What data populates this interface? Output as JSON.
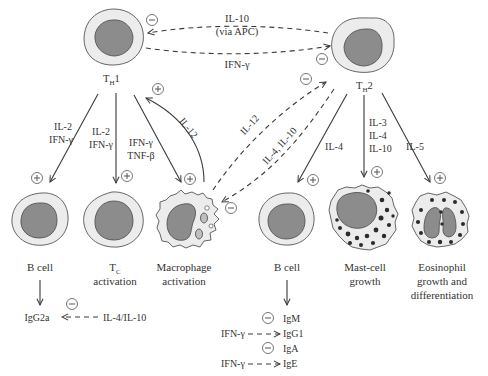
{
  "diagram": {
    "type": "immune-regulation-pathway",
    "cells": {
      "th1": {
        "label_main": "T",
        "label_sub": "H",
        "label_suffix": "1"
      },
      "th2": {
        "label_main": "T",
        "label_sub": "H",
        "label_suffix": "2"
      },
      "b_cell_left": {
        "caption": "B cell"
      },
      "tc": {
        "caption_main": "T",
        "caption_sub": "C",
        "caption_line2": "activation"
      },
      "macrophage": {
        "caption_line1": "Macrophage",
        "caption_line2": "activation"
      },
      "b_cell_right": {
        "caption": "B cell"
      },
      "mast_cell": {
        "caption_line1": "Mast-cell",
        "caption_line2": "growth"
      },
      "eosinophil": {
        "caption_line1": "Eosinophil",
        "caption_line2": "growth and",
        "caption_line3": "differentiation"
      }
    },
    "cross_regulation": {
      "th2_to_th1_line1": "IL-10",
      "th2_to_th1_line2": "(via APC)",
      "th1_to_th2": "IFN-γ"
    },
    "th1_arrows": {
      "to_bcell_line1": "IL-2",
      "to_bcell_line2": "IFN-γ",
      "to_tc_line1": "IL-2",
      "to_tc_line2": "IFN-γ",
      "to_macrophage_line1": "IFN-γ",
      "to_macrophage_line2": "TNF-β",
      "macrophage_to_th1": "IL-12"
    },
    "macrophage_th2": {
      "macrophage_to_th2": "IL-12",
      "th2_to_macrophage": "IL-4, IL-10"
    },
    "th2_arrows": {
      "to_bcell": "IL-4",
      "to_mast_line1": "IL-3",
      "to_mast_line2": "IL-4",
      "to_mast_line3": "IL-10",
      "to_eosinophil": "IL-5"
    },
    "left_isotype": {
      "product": "IgG2a",
      "inhibitor": "IL-4/IL-10"
    },
    "right_isotypes": {
      "items": [
        "IgM",
        "IgG1",
        "IgA",
        "IgE"
      ],
      "inhibitor_1": "IFN-γ",
      "inhibitor_2": "IFN-γ"
    },
    "signs": {
      "plus": "+",
      "minus": "−"
    }
  }
}
